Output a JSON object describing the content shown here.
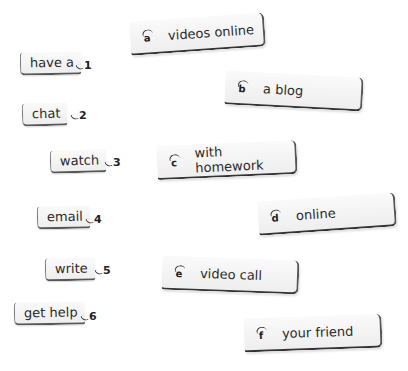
{
  "exercise": {
    "left_items": [
      {
        "number": "1",
        "label": "have a"
      },
      {
        "number": "2",
        "label": "chat"
      },
      {
        "number": "3",
        "label": "watch"
      },
      {
        "number": "4",
        "label": "email"
      },
      {
        "number": "5",
        "label": "write"
      },
      {
        "number": "6",
        "label": "get help"
      }
    ],
    "right_items": [
      {
        "letter": "a",
        "label": "videos online"
      },
      {
        "letter": "b",
        "label": "a blog"
      },
      {
        "letter": "c",
        "label": "with homework"
      },
      {
        "letter": "d",
        "label": "online"
      },
      {
        "letter": "e",
        "label": "video call"
      },
      {
        "letter": "f",
        "label": "your friend"
      }
    ]
  },
  "colors": {
    "card_fill": "#f0f0f0",
    "card_edge": "#333333",
    "text": "#2b2b2b"
  }
}
